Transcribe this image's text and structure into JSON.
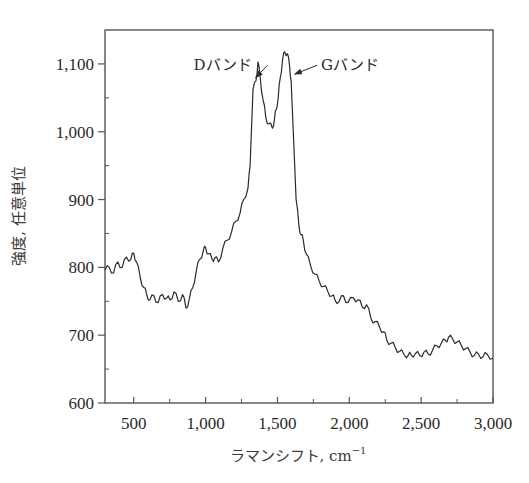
{
  "chart_data": {
    "type": "line",
    "title": "",
    "xlabel": "ラマンシフト, cm",
    "xlabel_superscript": "−1",
    "ylabel": "強度, 任意単位",
    "xlim": [
      300,
      3000
    ],
    "ylim": [
      600,
      1150
    ],
    "x_ticks": [
      500,
      1000,
      1500,
      2000,
      2500,
      3000
    ],
    "x_tick_labels": [
      "500",
      "1,000",
      "1,500",
      "2,000",
      "2,500",
      "3,000"
    ],
    "x_minor_ticks": [
      750,
      1250,
      1750,
      2250,
      2750
    ],
    "y_ticks": [
      600,
      700,
      800,
      900,
      1000,
      1100
    ],
    "y_tick_labels": [
      "600",
      "700",
      "800",
      "900",
      "1,000",
      "1,100"
    ],
    "y_minor_ticks": [
      650,
      750,
      850,
      950,
      1050
    ],
    "grid": false,
    "legend": null,
    "series": [
      {
        "name": "Raman spectrum",
        "color": "#2a2a2a",
        "x": [
          300,
          330,
          360,
          390,
          420,
          450,
          480,
          500,
          520,
          545,
          570,
          590,
          613,
          640,
          670,
          700,
          730,
          752,
          780,
          810,
          840,
          864,
          885,
          910,
          935,
          960,
          985,
          1000,
          1020,
          1045,
          1063,
          1090,
          1120,
          1150,
          1180,
          1210,
          1240,
          1265,
          1295,
          1310,
          1330,
          1350,
          1365,
          1380,
          1400,
          1420,
          1440,
          1465,
          1480,
          1490,
          1505,
          1520,
          1535,
          1550,
          1570,
          1585,
          1595,
          1610,
          1630,
          1650,
          1665,
          1680,
          1700,
          1730,
          1760,
          1790,
          1820,
          1850,
          1880,
          1900,
          1930,
          1960,
          1990,
          2030,
          2060,
          2090,
          2120,
          2150,
          2180,
          2210,
          2240,
          2260,
          2290,
          2320,
          2350,
          2380,
          2410,
          2430,
          2460,
          2490,
          2520,
          2550,
          2580,
          2610,
          2640,
          2670,
          2690,
          2720,
          2750,
          2780,
          2810,
          2840,
          2870,
          2900,
          2930,
          2960,
          3000
        ],
        "y": [
          796,
          800,
          792,
          808,
          800,
          815,
          812,
          821,
          808,
          785,
          770,
          760,
          752,
          758,
          748,
          760,
          755,
          752,
          764,
          750,
          760,
          740,
          752,
          770,
          795,
          812,
          825,
          829,
          820,
          812,
          814,
          808,
          828,
          840,
          852,
          868,
          880,
          900,
          917,
          950,
          1062,
          1075,
          1103,
          1080,
          1047,
          1020,
          1012,
          1005,
          1020,
          1032,
          1050,
          1080,
          1105,
          1118,
          1115,
          1095,
          1076,
          1000,
          900,
          860,
          848,
          840,
          820,
          803,
          790,
          780,
          772,
          765,
          758,
          752,
          750,
          758,
          748,
          755,
          752,
          742,
          745,
          725,
          720,
          712,
          705,
          693,
          688,
          682,
          676,
          672,
          670,
          671,
          673,
          670,
          675,
          672,
          678,
          684,
          688,
          692,
          697,
          694,
          690,
          685,
          680,
          675,
          670,
          672,
          668,
          672,
          666
        ]
      }
    ],
    "annotations": [
      {
        "text": "Dバンド",
        "target_x": 1370,
        "target_y": 1080,
        "label_x": 930,
        "label_y": 1098
      },
      {
        "text": "Gバンド",
        "target_x": 1600,
        "target_y": 1085,
        "label_x": 1790,
        "label_y": 1098
      }
    ]
  },
  "colors": {
    "line": "#2a2a2a",
    "axis": "#555555",
    "background": "#ffffff"
  }
}
